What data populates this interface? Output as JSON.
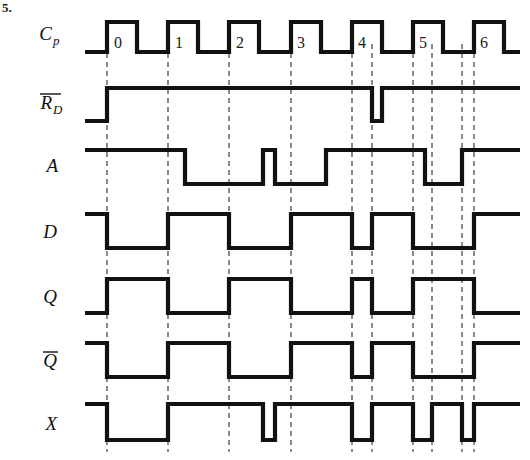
{
  "figure": {
    "corner_label": "5.",
    "title": "",
    "width": 530,
    "height": 460,
    "line_color": "#111111",
    "grid_color": "#2b2b2b",
    "background": "#ffffff"
  },
  "timing": {
    "t_start": 85,
    "t_end": 520,
    "clock_period": 61,
    "first_rising_edge": 107,
    "clock_high_width": 30
  },
  "chart_data": {
    "type": "line",
    "xlabel": "",
    "ylabel": "",
    "grid": true,
    "legend_position": "left",
    "clock_pulse_labels": [
      "0",
      "1",
      "2",
      "3",
      "4",
      "5",
      "6"
    ],
    "clock_pulse_label_x": [
      118,
      179,
      240,
      301,
      362,
      423,
      484
    ],
    "gridlines_x": [
      107,
      168,
      229,
      291,
      352,
      372,
      413,
      432,
      462,
      474
    ],
    "signals": [
      {
        "name": "Cp",
        "label": "C",
        "subscript": "p",
        "overbar": false,
        "row_y_high": 22,
        "row_y_low": 52,
        "initial": 0,
        "transitions": [
          [
            107,
            1
          ],
          [
            137,
            0
          ],
          [
            168,
            1
          ],
          [
            198,
            0
          ],
          [
            229,
            1
          ],
          [
            259,
            0
          ],
          [
            291,
            1
          ],
          [
            321,
            0
          ],
          [
            352,
            1
          ],
          [
            382,
            0
          ],
          [
            413,
            1
          ],
          [
            443,
            0
          ],
          [
            474,
            1
          ],
          [
            504,
            0
          ]
        ]
      },
      {
        "name": "RD",
        "label": "R",
        "subscript": "D",
        "overbar": true,
        "row_y_high": 88,
        "row_y_low": 121,
        "initial": 0,
        "transitions": [
          [
            107,
            1
          ],
          [
            372,
            0
          ],
          [
            382,
            1
          ]
        ]
      },
      {
        "name": "A",
        "label": "A",
        "subscript": "",
        "overbar": false,
        "row_y_high": 150,
        "row_y_low": 184,
        "initial": 1,
        "transitions": [
          [
            185,
            0
          ],
          [
            263,
            1
          ],
          [
            275,
            0
          ],
          [
            326,
            1
          ],
          [
            425,
            0
          ],
          [
            462,
            1
          ]
        ]
      },
      {
        "name": "D",
        "label": "D",
        "subscript": "",
        "overbar": false,
        "row_y_high": 214,
        "row_y_low": 248,
        "initial": 1,
        "transitions": [
          [
            107,
            0
          ],
          [
            168,
            1
          ],
          [
            229,
            0
          ],
          [
            291,
            1
          ],
          [
            352,
            0
          ],
          [
            372,
            1
          ],
          [
            413,
            0
          ],
          [
            474,
            1
          ]
        ]
      },
      {
        "name": "Q",
        "label": "Q",
        "subscript": "",
        "overbar": false,
        "row_y_high": 279,
        "row_y_low": 313,
        "initial": 0,
        "transitions": [
          [
            107,
            1
          ],
          [
            168,
            0
          ],
          [
            229,
            1
          ],
          [
            291,
            0
          ],
          [
            352,
            1
          ],
          [
            372,
            0
          ],
          [
            413,
            1
          ],
          [
            474,
            0
          ]
        ]
      },
      {
        "name": "Qbar",
        "label": "Q",
        "subscript": "",
        "overbar": true,
        "row_y_high": 343,
        "row_y_low": 377,
        "initial": 1,
        "transitions": [
          [
            107,
            0
          ],
          [
            168,
            1
          ],
          [
            229,
            0
          ],
          [
            291,
            1
          ],
          [
            352,
            0
          ],
          [
            372,
            1
          ],
          [
            413,
            0
          ],
          [
            474,
            1
          ]
        ]
      },
      {
        "name": "X",
        "label": "X",
        "subscript": "",
        "overbar": false,
        "row_y_high": 404,
        "row_y_low": 440,
        "initial": 1,
        "transitions": [
          [
            107,
            0
          ],
          [
            168,
            1
          ],
          [
            263,
            0
          ],
          [
            275,
            1
          ],
          [
            352,
            0
          ],
          [
            372,
            1
          ],
          [
            413,
            0
          ],
          [
            432,
            1
          ],
          [
            462,
            0
          ],
          [
            474,
            1
          ]
        ]
      }
    ],
    "label_positions": [
      {
        "name": "Cp",
        "x": 52,
        "y": 40
      },
      {
        "name": "RD",
        "x": 52,
        "y": 109
      },
      {
        "name": "A",
        "x": 58,
        "y": 172
      },
      {
        "name": "D",
        "x": 57,
        "y": 238
      },
      {
        "name": "Q",
        "x": 57,
        "y": 303
      },
      {
        "name": "Qbar",
        "x": 57,
        "y": 367
      },
      {
        "name": "X",
        "x": 57,
        "y": 430
      }
    ]
  }
}
